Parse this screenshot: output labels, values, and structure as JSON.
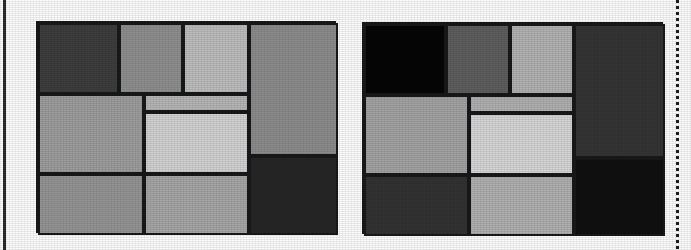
{
  "figure": {
    "type": "two-panel-treemap",
    "background_color": "#fdfdfd",
    "border_color": "#17181a",
    "panel_count": 2
  },
  "artifacts": {
    "left_margin_rule": {
      "name": "solid-scan-rule",
      "x": 3,
      "color": "#2b2b2b"
    },
    "right_margin_rule": {
      "name": "dashed-scan-rule",
      "x": 676,
      "color": "#1e1e1e"
    }
  },
  "chart_data": [
    {
      "type": "treemap",
      "title": "",
      "subtitle": "",
      "xlabel": "",
      "ylabel": "",
      "panel": "left",
      "grid": false,
      "legend": "none",
      "plot_box": {
        "x": 36,
        "y": 21,
        "width": 300,
        "height": 212
      },
      "colorscale": "grayscale",
      "nodes": [
        {
          "id": "L1",
          "label": "",
          "x": 0,
          "y": 0,
          "width": 81,
          "height": 71,
          "value": 5751,
          "color": "#3d3d3d"
        },
        {
          "id": "L2",
          "label": "",
          "x": 81,
          "y": 0,
          "width": 64,
          "height": 71,
          "value": 4544,
          "color": "#8f8f8f"
        },
        {
          "id": "L3",
          "label": "",
          "x": 145,
          "y": 0,
          "width": 66,
          "height": 71,
          "value": 4686,
          "color": "#bdbdbd"
        },
        {
          "id": "L4",
          "label": "",
          "x": 211,
          "y": 0,
          "width": 89,
          "height": 133,
          "value": 11837,
          "color": "#8c8c8c"
        },
        {
          "id": "L5",
          "label": "",
          "x": 0,
          "y": 71,
          "width": 106,
          "height": 80,
          "value": 8480,
          "color": "#9d9d9d"
        },
        {
          "id": "L6",
          "label": "",
          "x": 106,
          "y": 71,
          "width": 105,
          "height": 18,
          "value": 1890,
          "color": "#b6b6b6"
        },
        {
          "id": "L7",
          "label": "",
          "x": 106,
          "y": 89,
          "width": 105,
          "height": 62,
          "value": 6510,
          "color": "#d2d2d2"
        },
        {
          "id": "L8",
          "label": "",
          "x": 211,
          "y": 133,
          "width": 89,
          "height": 79,
          "value": 7031,
          "color": "#262626"
        },
        {
          "id": "L9",
          "label": "",
          "x": 0,
          "y": 151,
          "width": 106,
          "height": 61,
          "value": 6466,
          "color": "#959595"
        },
        {
          "id": "L10",
          "label": "",
          "x": 106,
          "y": 151,
          "width": 105,
          "height": 61,
          "value": 6405,
          "color": "#a6a6a6"
        }
      ]
    },
    {
      "type": "treemap",
      "title": "",
      "subtitle": "",
      "xlabel": "",
      "ylabel": "",
      "panel": "right",
      "grid": false,
      "legend": "none",
      "plot_box": {
        "x": 362,
        "y": 22,
        "width": 301,
        "height": 212
      },
      "colorscale": "grayscale",
      "nodes": [
        {
          "id": "R1",
          "label": "",
          "x": 0,
          "y": 0,
          "width": 82,
          "height": 71,
          "value": 5822,
          "color": "#050505"
        },
        {
          "id": "R2",
          "label": "",
          "x": 82,
          "y": 0,
          "width": 64,
          "height": 71,
          "value": 4544,
          "color": "#5e5e5e"
        },
        {
          "id": "R3",
          "label": "",
          "x": 146,
          "y": 0,
          "width": 64,
          "height": 71,
          "value": 4544,
          "color": "#b2b2b2"
        },
        {
          "id": "R4",
          "label": "",
          "x": 210,
          "y": 0,
          "width": 91,
          "height": 134,
          "value": 12194,
          "color": "#343434"
        },
        {
          "id": "R5",
          "label": "",
          "x": 0,
          "y": 71,
          "width": 105,
          "height": 80,
          "value": 8400,
          "color": "#a3a3a3"
        },
        {
          "id": "R6",
          "label": "",
          "x": 105,
          "y": 71,
          "width": 105,
          "height": 18,
          "value": 1890,
          "color": "#b0b0b0"
        },
        {
          "id": "R7",
          "label": "",
          "x": 105,
          "y": 89,
          "width": 105,
          "height": 62,
          "value": 6510,
          "color": "#d6d6d6"
        },
        {
          "id": "R8",
          "label": "",
          "x": 210,
          "y": 134,
          "width": 91,
          "height": 78,
          "value": 7098,
          "color": "#101010"
        },
        {
          "id": "R9",
          "label": "",
          "x": 0,
          "y": 151,
          "width": 105,
          "height": 61,
          "value": 6405,
          "color": "#323232"
        },
        {
          "id": "R10",
          "label": "",
          "x": 105,
          "y": 151,
          "width": 105,
          "height": 61,
          "value": 6405,
          "color": "#b0b0b0"
        }
      ]
    }
  ]
}
